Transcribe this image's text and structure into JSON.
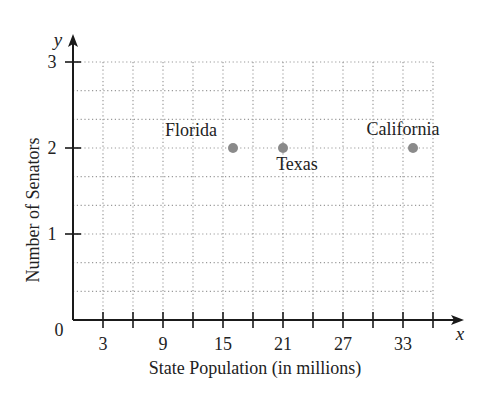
{
  "chart_data": {
    "type": "scatter",
    "title": "",
    "xlabel": "State Population (in millions)",
    "ylabel": "Number of Senators",
    "x_axis_symbol": "x",
    "y_axis_symbol": "y",
    "origin_label": "0",
    "x_ticks": [
      3,
      6,
      9,
      12,
      15,
      18,
      21,
      24,
      27,
      30,
      33,
      36
    ],
    "x_tick_labels": [
      "3",
      "9",
      "15",
      "21",
      "27",
      "33"
    ],
    "x_tick_label_values": [
      3,
      9,
      15,
      21,
      27,
      33
    ],
    "y_ticks": [
      1,
      2,
      3
    ],
    "y_tick_labels": [
      "1",
      "2",
      "3"
    ],
    "xlim": [
      0,
      36
    ],
    "ylim": [
      0,
      3
    ],
    "grid": true,
    "grid_style": "dotted",
    "y_minor_grid_step": 0.3333,
    "x_grid_step": 3,
    "points": [
      {
        "label": "Florida",
        "x": 16,
        "y": 2
      },
      {
        "label": "Texas",
        "x": 21,
        "y": 2
      },
      {
        "label": "California",
        "x": 34,
        "y": 2
      }
    ],
    "point_color": "#8a8a8a",
    "axis_color": "#1a1a1a",
    "grid_color": "#9a9a9a"
  }
}
